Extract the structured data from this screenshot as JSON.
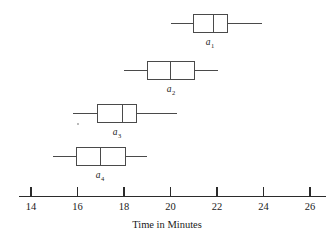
{
  "figure": {
    "kind": "box-and-whisker-plot",
    "axis_title": "Time in Minutes"
  },
  "axis": {
    "tick_labels": [
      "14",
      "16",
      "18",
      "20",
      "22",
      "24",
      "26"
    ],
    "tick_values": [
      14,
      16,
      18,
      20,
      22,
      24,
      26
    ],
    "min": 14,
    "max": 26,
    "pixel_min": 31,
    "pixel_max": 310,
    "baseline_y": 196,
    "tick_length": 9,
    "label_y": 210
  },
  "boxes": [
    {
      "id": "a1",
      "label_base": "a",
      "label_sub": "1",
      "center_y": 23,
      "label_x": 210,
      "label_y": 45,
      "min": 20.0,
      "q1": 21.0,
      "median": 21.85,
      "q3": 22.45,
      "max": 23.95
    },
    {
      "id": "a2",
      "label_base": "a",
      "label_sub": "2",
      "center_y": 70,
      "label_x": 171,
      "label_y": 92,
      "min": 18.0,
      "q1": 19.0,
      "median": 20.0,
      "q3": 21.05,
      "max": 22.05
    },
    {
      "id": "a3",
      "label_base": "a",
      "label_sub": "3",
      "center_y": 113,
      "label_x": 117,
      "label_y": 135,
      "min": 15.8,
      "q1": 16.85,
      "median": 17.95,
      "q3": 18.55,
      "max": 20.3
    },
    {
      "id": "a4",
      "label_base": "a",
      "label_sub": "4",
      "center_y": 156,
      "label_x": 100,
      "label_y": 178,
      "min": 14.95,
      "q1": 15.95,
      "median": 17.0,
      "q3": 18.05,
      "max": 19.0
    }
  ],
  "chart_data": {
    "type": "box",
    "title": "",
    "xlabel": "Time in Minutes",
    "ylabel": "",
    "xlim": [
      14,
      26
    ],
    "xticks": [
      14,
      16,
      18,
      20,
      22,
      24,
      26
    ],
    "grid": false,
    "legend": "none",
    "orientation": "horizontal",
    "categories": [
      "a1",
      "a2",
      "a3",
      "a4"
    ],
    "series": [
      {
        "name": "a1",
        "min": 20.0,
        "q1": 21.0,
        "median": 21.85,
        "q3": 22.45,
        "max": 23.95
      },
      {
        "name": "a2",
        "min": 18.0,
        "q1": 19.0,
        "median": 20.0,
        "q3": 21.05,
        "max": 22.05
      },
      {
        "name": "a3",
        "min": 15.8,
        "q1": 16.85,
        "median": 17.95,
        "q3": 18.55,
        "max": 20.3
      },
      {
        "name": "a4",
        "min": 14.95,
        "q1": 15.95,
        "median": 17.0,
        "q3": 18.05,
        "max": 19.0
      }
    ]
  }
}
